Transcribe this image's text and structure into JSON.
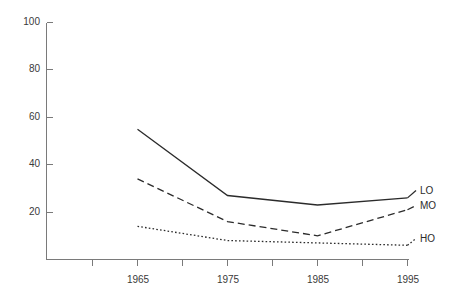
{
  "chart_data": {
    "type": "line",
    "title": "",
    "subtitle": "",
    "xlabel": "",
    "ylabel": "",
    "x": [
      1965,
      1975,
      1985,
      1995
    ],
    "xlim": [
      1960,
      1995
    ],
    "ylim": [
      0,
      100
    ],
    "x_tick_labels": [
      "1965",
      "1975",
      "1985",
      "1995"
    ],
    "y_tick_labels": [
      "20",
      "40",
      "60",
      "80",
      "100"
    ],
    "y_ticks": [
      20,
      40,
      60,
      80,
      100
    ],
    "minor_x_ticks": [
      1960,
      1970,
      1980,
      1990
    ],
    "grid": false,
    "legend_position": "right-inline",
    "series": [
      {
        "name": "LO",
        "label": "LO",
        "style": "solid",
        "color": "#2b2b2b",
        "values": [
          55,
          27,
          23,
          26
        ]
      },
      {
        "name": "MO",
        "label": "MO",
        "style": "dashed",
        "color": "#2b2b2b",
        "values": [
          34,
          16,
          10,
          21
        ]
      },
      {
        "name": "HO",
        "label": "HO",
        "style": "dotted",
        "color": "#2b2b2b",
        "values": [
          14,
          8,
          7,
          6
        ]
      }
    ]
  },
  "axes": {
    "y_labels": [
      "100",
      "80",
      "60",
      "40",
      "20"
    ],
    "x_labels": [
      "1965",
      "1975",
      "1985",
      "1995"
    ]
  },
  "legend": {
    "items": [
      {
        "label": "LO"
      },
      {
        "label": "MO"
      },
      {
        "label": "HO"
      }
    ]
  }
}
